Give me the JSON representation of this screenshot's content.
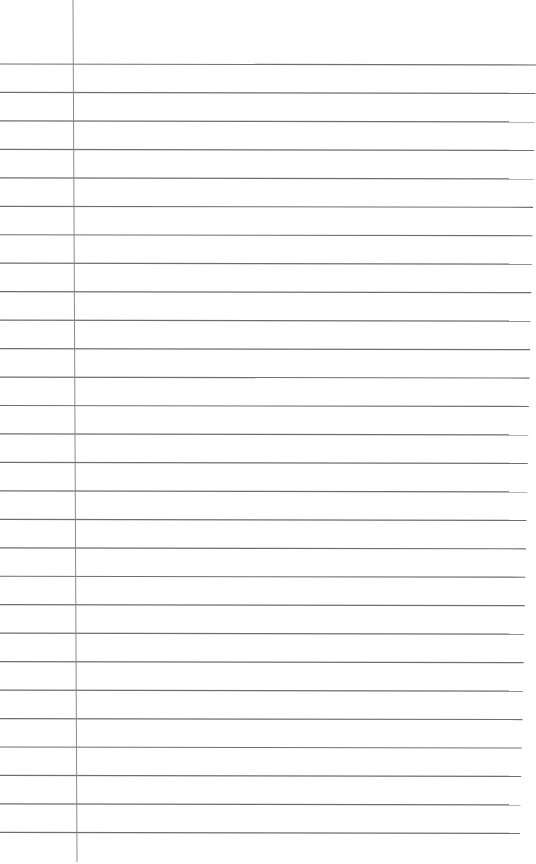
{
  "paper": {
    "type": "lined-paper",
    "background": "#ffffff",
    "rule_color": "#6e6e6e",
    "margin_color": "#8a8a8a",
    "line_count": 28,
    "first_line_y": 65,
    "line_spacing": 28.44,
    "margin_x_top": 73,
    "margin_x_bottom": 77
  }
}
